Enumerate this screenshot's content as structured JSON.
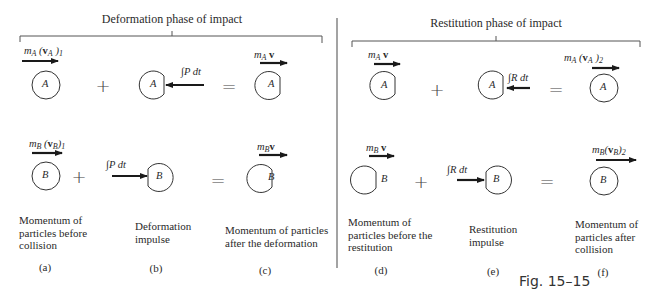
{
  "figure": {
    "caption": "Fig. 15–15",
    "colors": {
      "ink": "#2a2a2a",
      "background": "#ffffff"
    }
  },
  "phases": [
    {
      "title": "Deformation phase of impact",
      "row_a": {
        "initial": {
          "label_m": "m",
          "label_sub": "A",
          "label_rest": "(v",
          "label_sub2": "A",
          "label_end": ")",
          "label_sub3": "1",
          "particle": "A"
        },
        "impulse": {
          "label": "∫P dt",
          "particle": "A"
        },
        "result": {
          "label_m": "m",
          "label_sub": "A",
          "label_v": "v",
          "particle": "A"
        }
      },
      "row_b": {
        "initial": {
          "label_m": "m",
          "label_sub": "B",
          "label_sub2": "B",
          "label_sub3": "1",
          "particle": "B"
        },
        "impulse": {
          "label": "∫P dt",
          "particle": "B"
        },
        "result": {
          "label_sub": "B",
          "particle": "B"
        }
      },
      "columns": [
        {
          "desc_lines": [
            "Momentum of",
            "particles before",
            "collision"
          ],
          "tag": "(a)"
        },
        {
          "desc_lines": [
            "Deformation",
            "impulse"
          ],
          "tag": "(b)"
        },
        {
          "desc_lines": [
            "Momentum of particles",
            "after the deformation"
          ],
          "tag": "(c)"
        }
      ],
      "operators": {
        "plus": "+",
        "equals": "="
      }
    },
    {
      "title": "Restitution phase of impact",
      "row_a": {
        "initial": {
          "label_sub": "A",
          "particle": "A"
        },
        "impulse": {
          "label": "∫R dt",
          "particle": "A"
        },
        "result": {
          "label_sub": "A",
          "label_sub2": "A",
          "label_sub3": "2",
          "particle": "A"
        }
      },
      "row_b": {
        "initial": {
          "label_sub": "B",
          "particle": "B"
        },
        "impulse": {
          "label": "∫R dt",
          "particle": "B"
        },
        "result": {
          "label_sub": "B",
          "label_sub2": "B",
          "label_sub3": "2",
          "particle": "B"
        }
      },
      "columns": [
        {
          "desc_lines": [
            "Momentum of",
            "particles before the",
            "restitution"
          ],
          "tag": "(d)"
        },
        {
          "desc_lines": [
            "Restitution",
            "impulse"
          ],
          "tag": "(e)"
        },
        {
          "desc_lines": [
            "Momentum of",
            "particles after",
            "collision"
          ],
          "tag": "(f)"
        }
      ],
      "operators": {
        "plus": "+",
        "equals": "="
      }
    }
  ]
}
